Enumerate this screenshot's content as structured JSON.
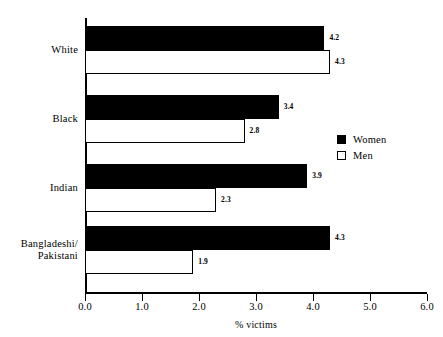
{
  "chart_data": {
    "type": "bar",
    "orientation": "horizontal",
    "title": "",
    "xlabel": "% victims",
    "ylabel": "",
    "xlim": [
      0.0,
      6.0
    ],
    "xticks": [
      "0.0",
      "1.0",
      "2.0",
      "3.0",
      "4.0",
      "5.0",
      "6.0"
    ],
    "grid": false,
    "legend_position": "right",
    "categories": [
      "White",
      "Black",
      "Indian",
      "Bangladeshi/\nPakistani"
    ],
    "series": [
      {
        "name": "Women",
        "color": "#000000",
        "values": [
          4.2,
          3.4,
          3.9,
          4.3
        ],
        "labels": [
          "4.2",
          "3.4",
          "3.9",
          "4.3"
        ]
      },
      {
        "name": "Men",
        "color": "#ffffff",
        "values": [
          4.3,
          2.8,
          2.3,
          1.9
        ],
        "labels": [
          "4.3",
          "2.8",
          "2.3",
          "1.9"
        ]
      }
    ]
  },
  "legend": {
    "items": [
      {
        "label": "Women",
        "swatch": "filled-square-icon"
      },
      {
        "label": "Men",
        "swatch": "hollow-square-icon"
      }
    ]
  }
}
